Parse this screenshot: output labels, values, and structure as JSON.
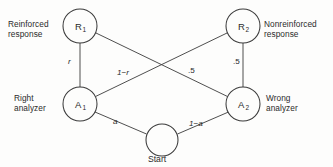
{
  "diagram": {
    "nodes": [
      {
        "id": "R1",
        "label": "R",
        "subscript": "1",
        "cx": 80,
        "cy": 26,
        "r": 17,
        "side_label": "Reinforced\nresponse",
        "side_label_line1": "Reinforced",
        "side_label_line2": "response"
      },
      {
        "id": "R2",
        "label": "R",
        "subscript": "2",
        "cx": 243,
        "cy": 26,
        "r": 17,
        "side_label_line1": "Nonreinforced",
        "side_label_line2": "response"
      },
      {
        "id": "A1",
        "label": "A",
        "subscript": "1",
        "cx": 80,
        "cy": 104,
        "r": 17,
        "side_label_line1": "Right",
        "side_label_line2": "analyzer"
      },
      {
        "id": "A2",
        "label": "A",
        "subscript": "2",
        "cx": 243,
        "cy": 104,
        "r": 17,
        "side_label_line1": "Wrong",
        "side_label_line2": "analyzer"
      },
      {
        "id": "Start",
        "label": "",
        "subscript": "",
        "cx": 162,
        "cy": 140,
        "r": 16,
        "caption": "Start"
      }
    ],
    "edges": [
      {
        "from": "A1",
        "to": "R1",
        "weight": "r",
        "italic": true
      },
      {
        "from": "A1",
        "to": "R2",
        "weight": "1−r",
        "italic": true
      },
      {
        "from": "A2",
        "to": "R1",
        "weight": ".5",
        "italic": false
      },
      {
        "from": "A2",
        "to": "R2",
        "weight": ".5",
        "italic": false
      },
      {
        "from": "Start",
        "to": "A1",
        "weight": "a",
        "italic": true
      },
      {
        "from": "Start",
        "to": "A2",
        "weight": "1−a",
        "italic": true
      }
    ],
    "colors": {
      "stroke": "#3b3b3b",
      "text": "#2b2b2b",
      "background": "#fdfdfc"
    }
  }
}
